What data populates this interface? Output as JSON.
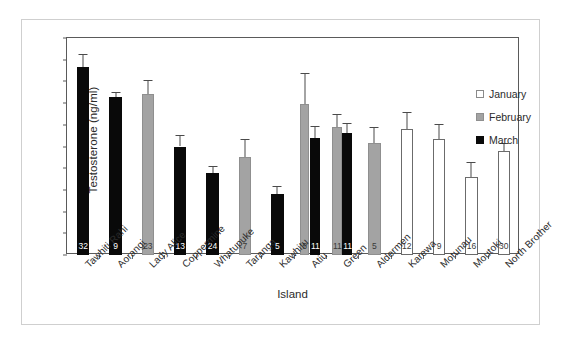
{
  "chart_data": {
    "type": "bar",
    "title": "",
    "xlabel": "Island",
    "ylabel": "Testosterone (ng/ml)",
    "ylim": [
      0,
      20
    ],
    "yticks": [
      0,
      2,
      4,
      6,
      8,
      10,
      12,
      14,
      16,
      18,
      20
    ],
    "grid": false,
    "legend_position": "top-right",
    "error_bars": "standard error",
    "bar_labels_note": "sample size (n) printed at base of each bar",
    "categories": [
      "Tawhiti Rahi",
      "Aorangi",
      "Lady Alice",
      "Coppermine",
      "Whatupuke",
      "Taranga",
      "Kawhitu",
      "Atiu",
      "Green",
      "Aldermen",
      "Karewa",
      "Motunau",
      "Moutoki",
      "North Brother"
    ],
    "legend": [
      {
        "label": "January",
        "color": "#ffffff"
      },
      {
        "label": "February",
        "color": "#a3a3a3"
      },
      {
        "label": "March",
        "color": "#090909"
      }
    ],
    "series": [
      {
        "name": "January",
        "color": "#ffffff",
        "values": [
          null,
          null,
          null,
          null,
          null,
          null,
          null,
          null,
          null,
          null,
          11.6,
          10.7,
          7.2,
          9.6
        ],
        "errors": [
          null,
          null,
          null,
          null,
          null,
          null,
          null,
          null,
          null,
          null,
          1.6,
          1.4,
          1.4,
          0.7
        ]
      },
      {
        "name": "February",
        "color": "#a3a3a3",
        "values": [
          null,
          null,
          14.8,
          null,
          null,
          9.0,
          null,
          13.9,
          11.8,
          10.3,
          null,
          null,
          null,
          null
        ],
        "errors": [
          null,
          null,
          1.3,
          null,
          null,
          1.7,
          null,
          2.9,
          1.2,
          1.5,
          null,
          null,
          null,
          null
        ]
      },
      {
        "name": "March",
        "color": "#090909",
        "values": [
          17.3,
          14.6,
          null,
          10.0,
          7.6,
          null,
          5.6,
          10.8,
          11.2,
          null,
          null,
          null,
          null,
          null
        ],
        "errors": [
          1.2,
          0.4,
          null,
          1.1,
          0.6,
          null,
          0.8,
          1.1,
          1.0,
          null,
          null,
          null,
          null,
          null
        ]
      }
    ],
    "bars": [
      {
        "category": "Tawhiti Rahi",
        "month": "March",
        "fill": "black",
        "value": 17.3,
        "error": 1.2,
        "n": "32"
      },
      {
        "category": "Aorangi",
        "month": "March",
        "fill": "black",
        "value": 14.6,
        "error": 0.4,
        "n": "9"
      },
      {
        "category": "Lady Alice",
        "month": "February",
        "fill": "grey",
        "value": 14.8,
        "error": 1.3,
        "n": "23"
      },
      {
        "category": "Coppermine",
        "month": "March",
        "fill": "black",
        "value": 10.0,
        "error": 1.1,
        "n": "13"
      },
      {
        "category": "Whatupuke",
        "month": "March",
        "fill": "black",
        "value": 7.6,
        "error": 0.6,
        "n": "24"
      },
      {
        "category": "Taranga",
        "month": "February",
        "fill": "grey",
        "value": 9.0,
        "error": 1.7,
        "n": "7"
      },
      {
        "category": "Kawhitu",
        "month": "March",
        "fill": "black",
        "value": 5.6,
        "error": 0.8,
        "n": "5"
      },
      {
        "category": "Atiu",
        "month": "February",
        "fill": "grey",
        "value": 13.9,
        "error": 2.9,
        "n": "5"
      },
      {
        "category": "Atiu",
        "month": "March",
        "fill": "black",
        "value": 10.8,
        "error": 1.1,
        "n": "11"
      },
      {
        "category": "Green",
        "month": "February",
        "fill": "grey",
        "value": 11.8,
        "error": 1.2,
        "n": "11"
      },
      {
        "category": "Green",
        "month": "March",
        "fill": "black",
        "value": 11.2,
        "error": 1.0,
        "n": "11"
      },
      {
        "category": "Aldermen",
        "month": "February",
        "fill": "grey",
        "value": 10.3,
        "error": 1.5,
        "n": "5"
      },
      {
        "category": "Karewa",
        "month": "January",
        "fill": "white",
        "value": 11.6,
        "error": 1.6,
        "n": "12"
      },
      {
        "category": "Motunau",
        "month": "January",
        "fill": "white",
        "value": 10.7,
        "error": 1.4,
        "n": "9"
      },
      {
        "category": "Moutoki",
        "month": "January",
        "fill": "white",
        "value": 7.2,
        "error": 1.4,
        "n": "16"
      },
      {
        "category": "North Brother",
        "month": "January",
        "fill": "white",
        "value": 9.6,
        "error": 0.7,
        "n": "30"
      }
    ]
  }
}
